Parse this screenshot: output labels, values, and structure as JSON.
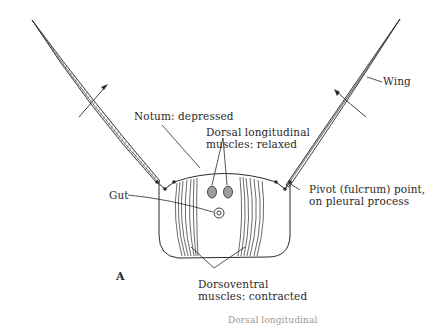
{
  "figure": {
    "panel_letter": "A",
    "labels": {
      "wing": "Wing",
      "notum": "Notum: depressed",
      "dorsal_longitudinal_line1": "Dorsal longitudinal",
      "dorsal_longitudinal_line2": "muscles: relaxed",
      "gut": "Gut",
      "pivot_line1": "Pivot (fulcrum) point,",
      "pivot_line2": "on pleural process",
      "dorsoventral_line1": "Dorsoventral",
      "dorsoventral_line2": "muscles: contracted",
      "clipped_bottom": "Dorsal longitudinal"
    },
    "colors": {
      "ink": "#2a2a2a",
      "muscle_fill": "#9c9c9c",
      "background": "#ffffff"
    }
  }
}
